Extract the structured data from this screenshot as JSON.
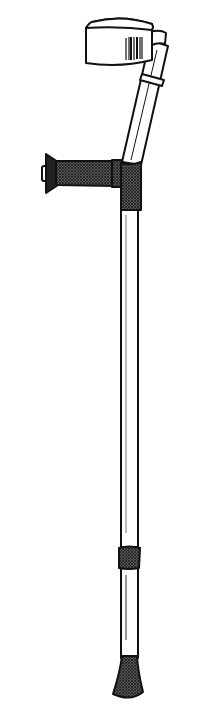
{
  "figure": {
    "style": "black and white line drawing",
    "colors": {
      "background": "#ffffff",
      "stroke": "#111111",
      "grip_fill": "#3a3a3a",
      "tube_fill": "#ffffff"
    },
    "parts": [
      "forearm-cuff",
      "cuff-clip",
      "upper-tube",
      "adjust-ring",
      "hand-grip",
      "grip-end-cap",
      "handle-joint",
      "main-shaft",
      "height-collar",
      "rubber-tip"
    ]
  }
}
